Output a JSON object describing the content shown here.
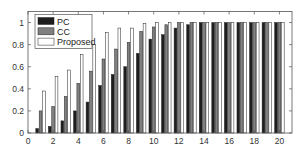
{
  "chart_data": {
    "type": "bar",
    "title": "",
    "xlabel": "",
    "ylabel": "",
    "categories": [
      1,
      2,
      3,
      4,
      5,
      6,
      7,
      8,
      9,
      10,
      11,
      12,
      13,
      14,
      15,
      16,
      17,
      18,
      19,
      20
    ],
    "series": [
      {
        "name": "PC",
        "color": "#1e1e1e",
        "values": [
          0.04,
          0.06,
          0.11,
          0.2,
          0.28,
          0.43,
          0.53,
          0.6,
          0.72,
          0.85,
          0.89,
          0.95,
          0.98,
          1.0,
          1.0,
          1.0,
          1.0,
          1.0,
          1.0,
          1.0
        ]
      },
      {
        "name": "CC",
        "color": "#808080",
        "values": [
          0.2,
          0.24,
          0.33,
          0.45,
          0.56,
          0.67,
          0.76,
          0.82,
          0.92,
          0.96,
          0.98,
          1.0,
          1.0,
          1.0,
          1.0,
          1.0,
          1.0,
          1.0,
          1.0,
          1.0
        ]
      },
      {
        "name": "Proposed",
        "color": "#ffffff",
        "values": [
          0.38,
          0.51,
          0.57,
          0.71,
          0.8,
          0.91,
          0.95,
          0.95,
          0.99,
          1.0,
          1.0,
          1.0,
          1.0,
          1.0,
          1.0,
          1.0,
          1.0,
          1.0,
          1.0,
          1.0
        ]
      }
    ],
    "xlim": [
      0,
      21
    ],
    "ylim": [
      0,
      1.1
    ],
    "xticks": [
      0,
      2,
      4,
      6,
      8,
      10,
      12,
      14,
      16,
      18,
      20
    ],
    "yticks": [
      0,
      0.2,
      0.4,
      0.6,
      0.8,
      1
    ],
    "ytick_labels": [
      "0",
      "0.2",
      "0.4",
      "0.6",
      "0.8",
      "1"
    ],
    "grid": false,
    "legend_position": "upper left"
  }
}
